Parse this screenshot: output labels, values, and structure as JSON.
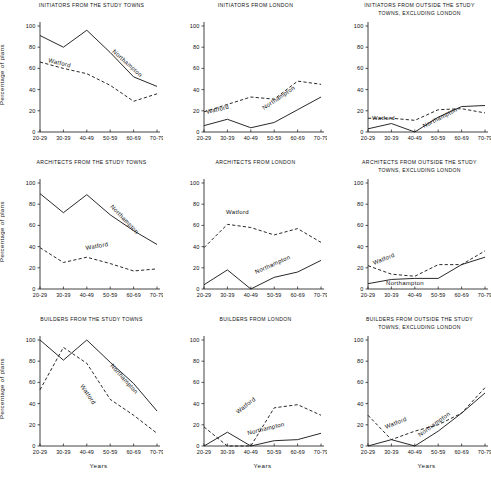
{
  "figure": {
    "axis": {
      "ylabel": "Percentage of plans",
      "xlabel": "Years",
      "yticks": [
        "0",
        "20",
        "40",
        "60",
        "80",
        "100"
      ],
      "ylim": [
        0,
        100
      ],
      "xticks": [
        "20-29",
        "30-39",
        "40-49",
        "50-59",
        "60-69",
        "70-79"
      ],
      "grid": false,
      "legend_position": "inline-annotation"
    },
    "series_names": [
      "Northampton",
      "Watford"
    ]
  },
  "chart_data": [
    {
      "type": "line",
      "title": "INITIATORS FROM THE STUDY TOWNS",
      "xlabel": "",
      "ylabel": "Percentage of plans",
      "ylim": [
        0,
        100
      ],
      "categories": [
        "20-29",
        "30-39",
        "40-49",
        "50-59",
        "60-69",
        "70-79"
      ],
      "series": [
        {
          "name": "Northampton",
          "style": "solid",
          "values": [
            91,
            80,
            96,
            75,
            52,
            43
          ]
        },
        {
          "name": "Watford",
          "style": "dashed",
          "values": [
            66,
            60,
            55,
            44,
            29,
            36
          ]
        }
      ]
    },
    {
      "type": "line",
      "title": "INITIATORS FROM LONDON",
      "xlabel": "",
      "ylabel": "Percentage of plans",
      "ylim": [
        0,
        100
      ],
      "categories": [
        "20-29",
        "30-39",
        "40-49",
        "50-59",
        "60-69",
        "70-79"
      ],
      "series": [
        {
          "name": "Northampton",
          "style": "solid",
          "values": [
            6,
            12,
            4,
            9,
            21,
            33
          ]
        },
        {
          "name": "Watford",
          "style": "dashed",
          "values": [
            19,
            26,
            33,
            31,
            48,
            45
          ]
        }
      ]
    },
    {
      "type": "line",
      "title": "INITIATORS FROM OUTSIDE THE STUDY\nTOWNS, EXCLUDING LONDON",
      "xlabel": "",
      "ylabel": "Percentage of plans",
      "ylim": [
        0,
        100
      ],
      "categories": [
        "20-29",
        "30-39",
        "40-49",
        "50-59",
        "60-69",
        "70-79"
      ],
      "series": [
        {
          "name": "Northampton",
          "style": "solid",
          "values": [
            3,
            8,
            0,
            14,
            24,
            25
          ]
        },
        {
          "name": "Watford",
          "style": "dashed",
          "values": [
            13,
            13,
            11,
            21,
            22,
            18
          ]
        }
      ]
    },
    {
      "type": "line",
      "title": "ARCHITECTS FROM THE STUDY TOWNS",
      "xlabel": "",
      "ylabel": "Percentage of plans",
      "ylim": [
        0,
        100
      ],
      "categories": [
        "20-29",
        "30-39",
        "40-49",
        "50-59",
        "60-69",
        "70-79"
      ],
      "series": [
        {
          "name": "Northampton",
          "style": "solid",
          "values": [
            90,
            72,
            89,
            70,
            55,
            42
          ]
        },
        {
          "name": "Watford",
          "style": "dashed",
          "values": [
            39,
            25,
            30,
            24,
            17,
            19
          ]
        }
      ]
    },
    {
      "type": "line",
      "title": "ARCHITECTS  FROM  LONDON",
      "xlabel": "",
      "ylabel": "Percentage of plans",
      "ylim": [
        0,
        100
      ],
      "categories": [
        "20-29",
        "30-39",
        "40-49",
        "50-59",
        "60-69",
        "70-79"
      ],
      "series": [
        {
          "name": "Northampton",
          "style": "solid",
          "values": [
            4,
            18,
            0,
            11,
            16,
            27
          ]
        },
        {
          "name": "Watford",
          "style": "dashed",
          "values": [
            39,
            61,
            58,
            51,
            57,
            44
          ]
        }
      ]
    },
    {
      "type": "line",
      "title": "ARCHITECTS FROM OUTSIDE THE STUDY\nTOWNS, EXCLUDING LONDON",
      "xlabel": "",
      "ylabel": "Percentage of plans",
      "ylim": [
        0,
        100
      ],
      "categories": [
        "20-29",
        "30-39",
        "40-49",
        "50-59",
        "60-69",
        "70-79"
      ],
      "series": [
        {
          "name": "Northampton",
          "style": "solid",
          "values": [
            5,
            9,
            10,
            10,
            23,
            30
          ]
        },
        {
          "name": "Watford",
          "style": "dashed",
          "values": [
            22,
            14,
            12,
            23,
            23,
            36
          ]
        }
      ]
    },
    {
      "type": "line",
      "title": "BUILDERS FROM THE STUDY TOWNS",
      "xlabel": "Years",
      "ylabel": "Percentage of plans",
      "ylim": [
        0,
        100
      ],
      "categories": [
        "20-29",
        "30-39",
        "40-49",
        "50-59",
        "60-69",
        "70-79"
      ],
      "series": [
        {
          "name": "Northampton",
          "style": "solid",
          "values": [
            100,
            81,
            100,
            79,
            59,
            33
          ]
        },
        {
          "name": "Watford",
          "style": "dashed",
          "values": [
            53,
            93,
            78,
            44,
            29,
            12
          ]
        }
      ]
    },
    {
      "type": "line",
      "title": "BUILDERS  FROM  LONDON",
      "xlabel": "Years",
      "ylabel": "Percentage of plans",
      "ylim": [
        0,
        100
      ],
      "categories": [
        "20-29",
        "30-39",
        "40-49",
        "50-59",
        "60-69",
        "70-79"
      ],
      "series": [
        {
          "name": "Northampton",
          "style": "solid",
          "values": [
            0,
            13,
            0,
            5,
            6,
            12
          ]
        },
        {
          "name": "Watford",
          "style": "dashed",
          "values": [
            18,
            0,
            0,
            36,
            39,
            29
          ]
        }
      ]
    },
    {
      "type": "line",
      "title": "BUILDERS FROM OUTSIDE THE STUDY\nTOWNS, EXCLUDING LONDON",
      "xlabel": "Years",
      "ylabel": "Percentage of plans",
      "ylim": [
        0,
        100
      ],
      "categories": [
        "20-29",
        "30-39",
        "40-49",
        "50-59",
        "60-69",
        "70-79"
      ],
      "series": [
        {
          "name": "Northampton",
          "style": "solid",
          "values": [
            0,
            6,
            0,
            14,
            31,
            50
          ]
        },
        {
          "name": "Watford",
          "style": "dashed",
          "values": [
            29,
            6,
            14,
            20,
            31,
            55
          ]
        }
      ]
    }
  ]
}
